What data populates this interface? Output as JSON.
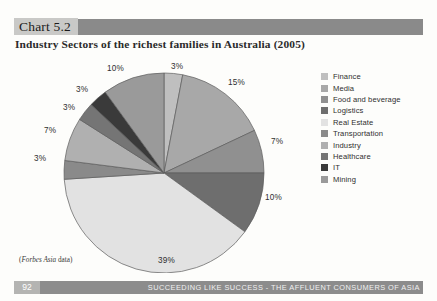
{
  "header": {
    "chart_number": "Chart 5.2",
    "title": "Industry Sectors of the richest families in Australia (2005)",
    "band_color": "#8a8a8a",
    "number_bg_color": "#c9c9c7"
  },
  "source_note": {
    "prefix": "(",
    "italic": "Forbes Asia",
    "suffix": " data)"
  },
  "footer": {
    "page_number": "92",
    "text": "SUCCEEDING LIKE SUCCESS - THE AFFLUENT CONSUMERS OF ASIA",
    "band_color": "#8c8c8c",
    "page_number_bg": "#b4b4b2"
  },
  "legend": {
    "items": [
      {
        "label": "Finance",
        "color": "#bfbfbf"
      },
      {
        "label": "Media",
        "color": "#a8a8a8"
      },
      {
        "label": "Food and beverage",
        "color": "#909090"
      },
      {
        "label": "Logistics",
        "color": "#6e6e6e"
      },
      {
        "label": "Real Estate",
        "color": "#e2e2e2"
      },
      {
        "label": "Transportation",
        "color": "#8a8a8a"
      },
      {
        "label": "Industry",
        "color": "#b0b0b0"
      },
      {
        "label": "Healthcare",
        "color": "#757575"
      },
      {
        "label": "IT",
        "color": "#3a3a3a"
      },
      {
        "label": "Mining",
        "color": "#9a9a9a"
      }
    ]
  },
  "chart_data": {
    "type": "pie",
    "title": "Industry Sectors of the richest families in Australia (2005)",
    "unit": "percent",
    "legend_position": "right",
    "grid": false,
    "categories": [
      "Finance",
      "Media",
      "Food and beverage",
      "Logistics",
      "Real Estate",
      "Transportation",
      "Industry",
      "Healthcare",
      "IT",
      "Mining"
    ],
    "values": [
      3,
      15,
      7,
      10,
      39,
      3,
      7,
      3,
      3,
      10
    ],
    "labels": [
      "3%",
      "15%",
      "7%",
      "10%",
      "39%",
      "3%",
      "7%",
      "3%",
      "3%",
      "10%"
    ],
    "colors": [
      "#bfbfbf",
      "#a8a8a8",
      "#909090",
      "#6e6e6e",
      "#e2e2e2",
      "#8a8a8a",
      "#b0b0b0",
      "#757575",
      "#3a3a3a",
      "#9a9a9a"
    ],
    "start_angle_deg": 0,
    "direction": "clockwise",
    "label_positions": [
      {
        "label": "3%",
        "x": 147,
        "y": 4
      },
      {
        "label": "15%",
        "x": 204,
        "y": 20
      },
      {
        "label": "7%",
        "x": 247,
        "y": 79
      },
      {
        "label": "10%",
        "x": 241,
        "y": 135
      },
      {
        "label": "39%",
        "x": 134,
        "y": 198
      },
      {
        "label": "3%",
        "x": 10,
        "y": 96
      },
      {
        "label": "7%",
        "x": 20,
        "y": 68
      },
      {
        "label": "3%",
        "x": 39,
        "y": 45
      },
      {
        "label": "3%",
        "x": 52,
        "y": 27
      },
      {
        "label": "10%",
        "x": 83,
        "y": 6
      }
    ]
  }
}
